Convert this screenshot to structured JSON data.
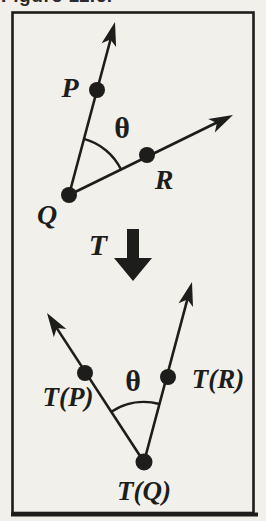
{
  "figure": {
    "caption": "Figure 11.6.",
    "colors": {
      "ink": "#1d1d1b",
      "paper": "#f2f0ea",
      "caption_text": "#2a2a2a"
    },
    "top_diagram": {
      "point_p": "P",
      "point_q": "Q",
      "point_r": "R",
      "angle": "θ"
    },
    "transform": {
      "label": "T",
      "arrow_icon": "thick-down-block-arrow"
    },
    "bottom_diagram": {
      "point_tp": "T(P)",
      "point_tq": "T(Q)",
      "point_tr": "T(R)",
      "angle": "θ"
    }
  }
}
